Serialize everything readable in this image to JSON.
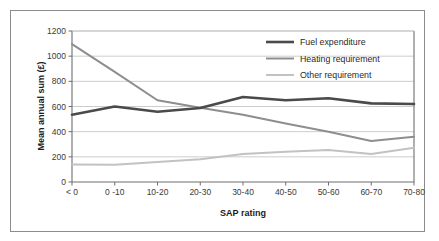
{
  "chart_data": {
    "type": "line",
    "title": "",
    "xlabel": "SAP rating",
    "ylabel": "Mean annual sum (£)",
    "categories": [
      "< 0",
      "0 -10",
      "10-20",
      "20-30",
      "30-40",
      "40-50",
      "50-60",
      "60-70",
      "70-80"
    ],
    "ylim": [
      0,
      1200
    ],
    "yticks": [
      0,
      200,
      400,
      600,
      800,
      1000,
      1200
    ],
    "ytick_labels": [
      "0",
      "200",
      "400",
      "600",
      "800",
      "1000",
      "1200"
    ],
    "grid": "horizontal",
    "legend_position": "top-right",
    "series": [
      {
        "name": "Fuel expenditure",
        "color": "#4a4a4a",
        "values": [
          535,
          600,
          558,
          588,
          675,
          650,
          665,
          625,
          620
        ]
      },
      {
        "name": "Heating requirement",
        "color": "#8e8e8e",
        "values": [
          1095,
          875,
          650,
          590,
          535,
          465,
          400,
          325,
          360
        ]
      },
      {
        "name": "Other requirement",
        "color": "#c2c2c2",
        "values": [
          140,
          138,
          158,
          180,
          222,
          240,
          255,
          222,
          272
        ]
      }
    ]
  },
  "frame": {
    "border_color": "#8c8c8c"
  },
  "axes": {
    "line_color": "#6e6e6e",
    "grid_color": "#bfbfbf"
  }
}
